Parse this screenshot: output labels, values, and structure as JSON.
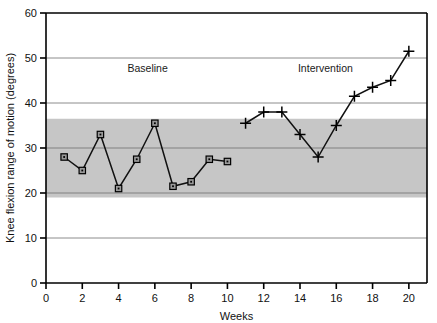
{
  "chart_data": {
    "type": "line",
    "title": "",
    "xlabel": "Weeks",
    "ylabel": "Knee flexion range of motion (degrees)",
    "xlim": [
      0,
      21
    ],
    "ylim": [
      0,
      60
    ],
    "x_ticks": [
      0,
      2,
      4,
      6,
      8,
      10,
      12,
      14,
      16,
      18,
      20
    ],
    "x_tick_labels": [
      "0",
      "2",
      "4",
      "6",
      "8",
      "10",
      "12",
      "14",
      "16",
      "18",
      "20"
    ],
    "y_ticks": [
      0,
      10,
      20,
      30,
      40,
      50,
      60
    ],
    "y_tick_labels": [
      "0",
      "10",
      "20",
      "30",
      "40",
      "50",
      "60"
    ],
    "grid": true,
    "gridlines_y": [
      10,
      20,
      30,
      40,
      50
    ],
    "shaded_band": {
      "label": "reference-band",
      "y_min": 19,
      "y_max": 36.5,
      "color": "#c6c6c6"
    },
    "annotations": [
      {
        "text": "Baseline",
        "x": 5.6,
        "y": 47
      },
      {
        "text": "Intervention",
        "x": 15.4,
        "y": 47
      }
    ],
    "series": [
      {
        "name": "Baseline",
        "marker": "square-dot",
        "color": "#111111",
        "x": [
          1,
          2,
          3,
          4,
          5,
          6,
          7,
          8,
          9,
          10
        ],
        "values": [
          28,
          25,
          33,
          21,
          27.5,
          35.5,
          21.5,
          22.5,
          27.5,
          27
        ]
      },
      {
        "name": "Intervention",
        "marker": "cross",
        "color": "#111111",
        "x": [
          11,
          12,
          13,
          14,
          15,
          16,
          17,
          18,
          19,
          20
        ],
        "values": [
          35.5,
          38,
          38,
          33,
          28,
          35,
          41.5,
          43.5,
          45,
          51.5
        ]
      }
    ]
  },
  "axes": {
    "x_axis_name": "weeks-axis",
    "y_axis_name": "degrees-axis"
  }
}
